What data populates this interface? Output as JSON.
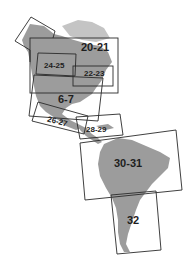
{
  "map": {
    "title": "",
    "land_color": "#9c9c9c",
    "line_color": "#2a2a2a",
    "label_color": "#1e1e1e",
    "background": "#ffffff"
  },
  "frames": [
    {
      "id": "20-21",
      "label": "20-21"
    },
    {
      "id": "24-25",
      "label": "24-25"
    },
    {
      "id": "22-23",
      "label": "22-23"
    },
    {
      "id": "6-7",
      "label": "6-7"
    },
    {
      "id": "26-27",
      "label": "26-27"
    },
    {
      "id": "28-29",
      "label": "28-29"
    },
    {
      "id": "30-31",
      "label": "30-31"
    },
    {
      "id": "32",
      "label": "32"
    }
  ]
}
